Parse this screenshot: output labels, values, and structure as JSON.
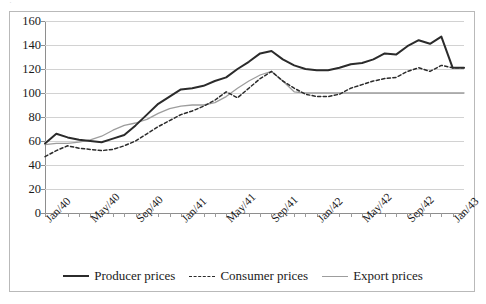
{
  "top_fragment": "·",
  "chart_data": {
    "type": "line",
    "title": "",
    "xlabel": "",
    "ylabel": "",
    "ylim": [
      0,
      160
    ],
    "ytick_step": 20,
    "yticks": [
      0,
      20,
      40,
      60,
      80,
      100,
      120,
      140,
      160
    ],
    "grid": true,
    "legend_position": "bottom",
    "x_tick_labels": [
      "Jan/40",
      "May/40",
      "Sep/40",
      "Jan/41",
      "May/41",
      "Sep/41",
      "Jan/42",
      "May/42",
      "Sep/42",
      "Jan/43"
    ],
    "x_tick_step_months": 4,
    "x": [
      "Jan/40",
      "Feb/40",
      "Mar/40",
      "Apr/40",
      "May/40",
      "Jun/40",
      "Jul/40",
      "Aug/40",
      "Sep/40",
      "Oct/40",
      "Nov/40",
      "Dec/40",
      "Jan/41",
      "Feb/41",
      "Mar/41",
      "Apr/41",
      "May/41",
      "Jun/41",
      "Jul/41",
      "Aug/41",
      "Sep/41",
      "Oct/41",
      "Nov/41",
      "Dec/41",
      "Jan/42",
      "Feb/42",
      "Mar/42",
      "Apr/42",
      "May/42",
      "Jun/42",
      "Jul/42",
      "Aug/42",
      "Sep/42",
      "Oct/42",
      "Nov/42",
      "Dec/42",
      "Jan/43",
      "Feb/43"
    ],
    "series": [
      {
        "name": "Producer prices",
        "style": "solid",
        "color": "#2b2b2b",
        "values": [
          58,
          66,
          63,
          61,
          60,
          59,
          62,
          65,
          73,
          82,
          91,
          97,
          103,
          104,
          106,
          110,
          113,
          120,
          126,
          133,
          135,
          128,
          123,
          120,
          119,
          119,
          121,
          124,
          125,
          128,
          133,
          132,
          139,
          144,
          141,
          147,
          121,
          121
        ]
      },
      {
        "name": "Consumer prices",
        "style": "dashed",
        "color": "#2b2b2b",
        "values": [
          47,
          52,
          56,
          54,
          53,
          52,
          53,
          56,
          60,
          66,
          72,
          77,
          82,
          85,
          89,
          94,
          101,
          96,
          104,
          112,
          118,
          110,
          104,
          99,
          97,
          97,
          99,
          104,
          107,
          110,
          112,
          113,
          118,
          121,
          118,
          123,
          121,
          121
        ]
      },
      {
        "name": "Export prices",
        "style": "solid-thin",
        "color": "#9d9d9d",
        "values": [
          57,
          58,
          58,
          59,
          61,
          64,
          69,
          73,
          75,
          78,
          83,
          87,
          89,
          90,
          90,
          92,
          97,
          104,
          110,
          115,
          118,
          110,
          101,
          100,
          100,
          100,
          100,
          100,
          100,
          100,
          100,
          100,
          100,
          100,
          100,
          100,
          100,
          100
        ]
      }
    ]
  },
  "legend": {
    "items": [
      {
        "label": "Producer prices"
      },
      {
        "label": "Consumer prices"
      },
      {
        "label": "Export prices"
      }
    ]
  }
}
